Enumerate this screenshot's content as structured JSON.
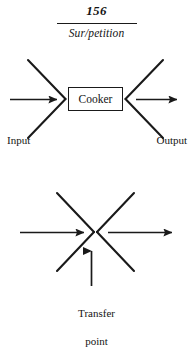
{
  "header": {
    "folio": "156",
    "book_title": "Sur/petition"
  },
  "figures": [
    {
      "id": "cooker-diagram",
      "box_label": "Cooker",
      "left_caption": "Input",
      "right_caption": "Output"
    },
    {
      "id": "transfer-point-diagram",
      "caption_line_1": "Transfer",
      "caption_line_2": "point"
    }
  ],
  "style": {
    "ink": "#1a1a1a",
    "paper": "#ffffff"
  }
}
